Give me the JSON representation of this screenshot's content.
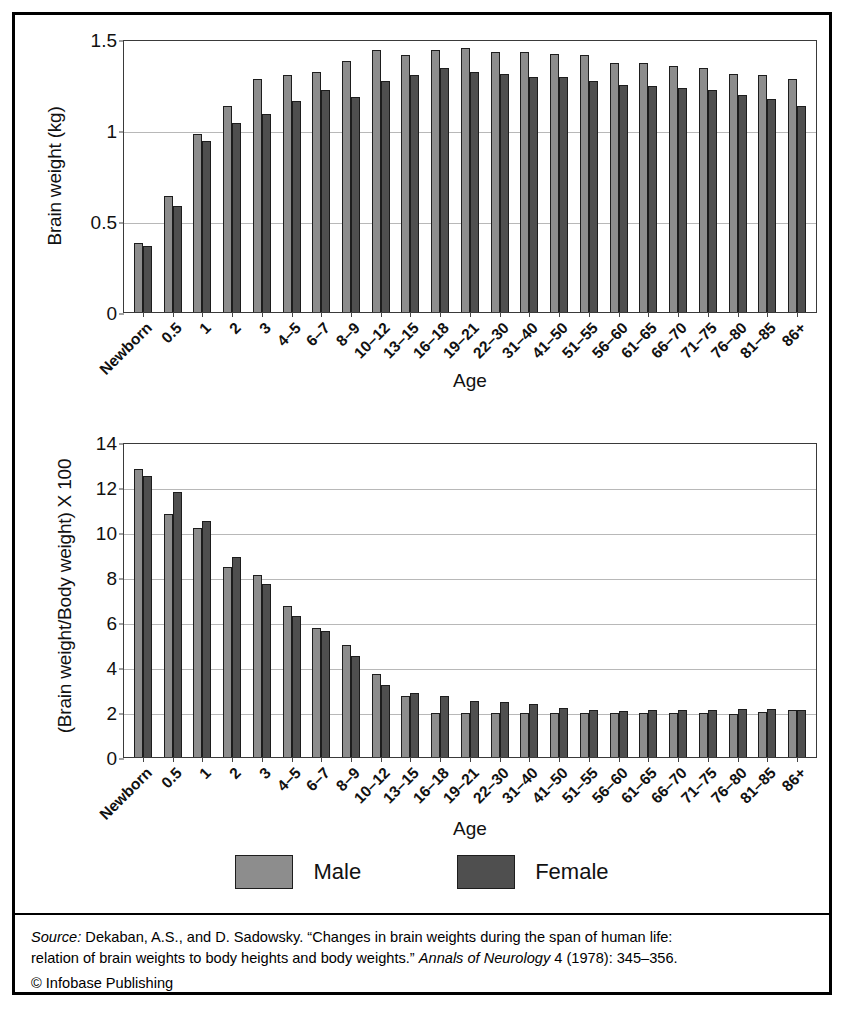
{
  "legend": {
    "male_label": "Male",
    "female_label": "Female",
    "male_color": "#8d8d8d",
    "female_color": "#4f4f4f"
  },
  "footer": {
    "source_prefix": "Source:",
    "source_line1_a": " Dekaban, A.S., and D. Sadowsky. “Changes in brain weights during the span of human life:",
    "source_line2_a": "relation of brain weights to body heights and body weights.” ",
    "source_journal": "Annals of Neurology",
    "source_line2_b": " 4 (1978): 345–356.",
    "copyright": "© Infobase Publishing"
  },
  "chart_data": [
    {
      "type": "bar",
      "title": "",
      "xlabel": "Age",
      "ylabel": "Brain weight (kg)",
      "ylim": [
        0,
        1.5
      ],
      "yticks": [
        0,
        0.5,
        1,
        1.5
      ],
      "ytick_labels": [
        "0",
        "0.5",
        "1",
        "1.5"
      ],
      "grid": true,
      "legend_position": "bottom",
      "categories": [
        "Newborn",
        "0.5",
        "1",
        "2",
        "3",
        "4–5",
        "6–7",
        "8–9",
        "10–12",
        "13–15",
        "16–18",
        "19–21",
        "22–30",
        "31–40",
        "41–50",
        "51–55",
        "56–60",
        "61–65",
        "66–70",
        "71–75",
        "76–80",
        "81–85",
        "86+"
      ],
      "series": [
        {
          "name": "Male",
          "color": "#8d8d8d",
          "values": [
            0.38,
            0.64,
            0.98,
            1.13,
            1.28,
            1.3,
            1.32,
            1.38,
            1.44,
            1.41,
            1.44,
            1.45,
            1.43,
            1.43,
            1.42,
            1.41,
            1.37,
            1.37,
            1.35,
            1.34,
            1.31,
            1.3,
            1.28
          ]
        },
        {
          "name": "Female",
          "color": "#4f4f4f",
          "values": [
            0.36,
            0.58,
            0.94,
            1.04,
            1.09,
            1.16,
            1.22,
            1.18,
            1.27,
            1.3,
            1.34,
            1.32,
            1.31,
            1.29,
            1.29,
            1.27,
            1.25,
            1.24,
            1.23,
            1.22,
            1.19,
            1.17,
            1.13
          ]
        }
      ]
    },
    {
      "type": "bar",
      "title": "",
      "xlabel": "Age",
      "ylabel": "(Brain weight/Body weight) X 100",
      "ylim": [
        0,
        14
      ],
      "yticks": [
        0,
        2,
        4,
        6,
        8,
        10,
        12,
        14
      ],
      "ytick_labels": [
        "0",
        "2",
        "4",
        "6",
        "8",
        "10",
        "12",
        "14"
      ],
      "grid": true,
      "legend_position": "bottom",
      "categories": [
        "Newborn",
        "0.5",
        "1",
        "2",
        "3",
        "4–5",
        "6–7",
        "8–9",
        "10–12",
        "13–15",
        "16–18",
        "19–21",
        "22–30",
        "31–40",
        "41–50",
        "51–55",
        "56–60",
        "61–65",
        "66–70",
        "71–75",
        "76–80",
        "81–85",
        "86+"
      ],
      "series": [
        {
          "name": "Male",
          "color": "#8d8d8d",
          "values": [
            12.8,
            10.8,
            10.2,
            8.45,
            8.1,
            6.7,
            5.75,
            5.0,
            3.7,
            2.7,
            1.95,
            1.95,
            1.95,
            1.95,
            1.95,
            1.95,
            1.95,
            1.95,
            1.95,
            1.95,
            1.9,
            2.0,
            2.1
          ]
        },
        {
          "name": "Female",
          "color": "#4f4f4f",
          "values": [
            12.5,
            11.8,
            10.5,
            8.9,
            7.7,
            6.25,
            5.6,
            4.5,
            3.2,
            2.85,
            2.7,
            2.5,
            2.45,
            2.35,
            2.2,
            2.1,
            2.05,
            2.1,
            2.1,
            2.1,
            2.15,
            2.15,
            2.1
          ]
        }
      ]
    }
  ]
}
